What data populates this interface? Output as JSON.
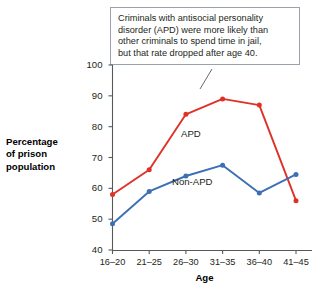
{
  "callout": {
    "lines": [
      "Criminals with antisocial personality",
      "disorder (APD) were more likely than",
      "other criminals to spend time in jail,",
      "but that rate dropped after age 40."
    ]
  },
  "axis_title": {
    "y_lines": [
      "Percentage",
      "of prison",
      "population"
    ],
    "x": "Age"
  },
  "colors": {
    "apd": "#e03127",
    "non_apd": "#3d6fb4",
    "axis": "#58595b",
    "callout_border": "#9aa3ab",
    "text": "#231f20",
    "background": "#ffffff"
  },
  "chart_data": {
    "type": "line",
    "title": "",
    "xlabel": "Age",
    "ylabel": "Percentage of prison population",
    "categories": [
      "16–20",
      "21–25",
      "26–30",
      "31–35",
      "36–40",
      "41–45"
    ],
    "ylim": [
      40,
      100
    ],
    "yticks": [
      40,
      50,
      60,
      70,
      80,
      90,
      100
    ],
    "grid": false,
    "legend": "inline-labels",
    "series": [
      {
        "name": "APD",
        "color": "#e03127",
        "values": [
          58,
          66,
          84,
          89,
          87,
          56
        ]
      },
      {
        "name": "Non-APD",
        "color": "#3d6fb4",
        "values": [
          48.5,
          59,
          64,
          67.5,
          58.5,
          64.5
        ]
      }
    ],
    "annotations": [
      {
        "text": "Criminals with antisocial personality disorder (APD) were more likely than other criminals to spend time in jail, but that rate dropped after age 40.",
        "points_to": "31–35"
      }
    ]
  }
}
